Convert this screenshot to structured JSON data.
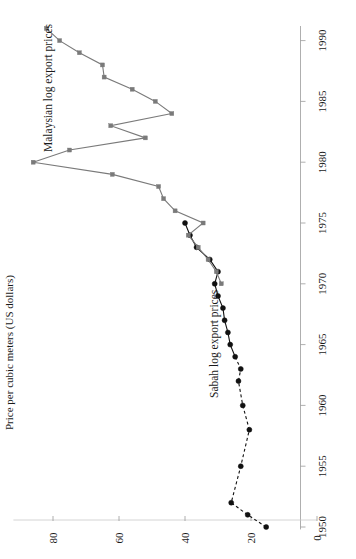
{
  "chart_data": {
    "type": "line",
    "title": "",
    "orientation": "rotated-90",
    "xlabel": "Price per cubic meters (US dollars)",
    "ylabel": "",
    "value_axis": {
      "name": "Price per cubic meters (US dollars)",
      "ticks": [
        0,
        20,
        40,
        60,
        80
      ],
      "tick_labels": [
        "0",
        "20",
        "40",
        "60",
        "80"
      ],
      "range": [
        0,
        92
      ]
    },
    "year_axis": {
      "name": "",
      "ticks": [
        1950,
        1955,
        1960,
        1965,
        1970,
        1975,
        1980,
        1985,
        1990
      ],
      "tick_labels": [
        "1950",
        "1955",
        "1960",
        "1965",
        "1970",
        "1975",
        "1980",
        "1985",
        "1990"
      ],
      "range": [
        1949,
        1991
      ]
    },
    "grid": false,
    "legend": "inline-annotations",
    "series": [
      {
        "name": "Sabah log export prices",
        "color": "#111111",
        "marker": "filled-circle",
        "dashed_until": 1963,
        "points": [
          {
            "year": 1950,
            "value": 15.4
          },
          {
            "year": 1951,
            "value": 21.0
          },
          {
            "year": 1952,
            "value": 26.0
          },
          {
            "year": 1955,
            "value": 23.1
          },
          {
            "year": 1958,
            "value": 20.5
          },
          {
            "year": 1960,
            "value": 22.5
          },
          {
            "year": 1962,
            "value": 23.8
          },
          {
            "year": 1963,
            "value": 23.1
          },
          {
            "year": 1964,
            "value": 24.8
          },
          {
            "year": 1965,
            "value": 26.3
          },
          {
            "year": 1966,
            "value": 27.0
          },
          {
            "year": 1967,
            "value": 28.0
          },
          {
            "year": 1968,
            "value": 28.5
          },
          {
            "year": 1969,
            "value": 30.0
          },
          {
            "year": 1970,
            "value": 31.0
          },
          {
            "year": 1971,
            "value": 30.0
          },
          {
            "year": 1972,
            "value": 32.5
          },
          {
            "year": 1973,
            "value": 36.5
          },
          {
            "year": 1974,
            "value": 38.5
          },
          {
            "year": 1975,
            "value": 40.0
          }
        ]
      },
      {
        "name": "Malaysian log export prices",
        "color": "#7a7a7a",
        "marker": "small-square",
        "dashed_until": null,
        "points": [
          {
            "year": 1970,
            "value": 29.0
          },
          {
            "year": 1971,
            "value": 30.5
          },
          {
            "year": 1972,
            "value": 33.0
          },
          {
            "year": 1973,
            "value": 36.0
          },
          {
            "year": 1974,
            "value": 39.0
          },
          {
            "year": 1975,
            "value": 34.5
          },
          {
            "year": 1976,
            "value": 43.0
          },
          {
            "year": 1977,
            "value": 46.5
          },
          {
            "year": 1978,
            "value": 48.0
          },
          {
            "year": 1979,
            "value": 62.0
          },
          {
            "year": 1980,
            "value": 86.0
          },
          {
            "year": 1981,
            "value": 75.0
          },
          {
            "year": 1982,
            "value": 52.0
          },
          {
            "year": 1983,
            "value": 62.5
          },
          {
            "year": 1984,
            "value": 44.0
          },
          {
            "year": 1985,
            "value": 49.0
          },
          {
            "year": 1986,
            "value": 56.0
          },
          {
            "year": 1987,
            "value": 64.5
          },
          {
            "year": 1988,
            "value": 65.0
          },
          {
            "year": 1989,
            "value": 72.0
          },
          {
            "year": 1990,
            "value": 78.0
          },
          {
            "year": 1991,
            "value": 82.0
          }
        ]
      }
    ],
    "annotations": [
      {
        "text": "Malaysian log export prices",
        "series": "Malaysian log export prices"
      },
      {
        "text": "Sabah log export prices",
        "series": "Sabah log export prices"
      }
    ]
  },
  "axis": {
    "value_title": "Price per cubic meters (US dollars)",
    "value_ticks": [
      "80",
      "60",
      "40",
      "20",
      "0"
    ],
    "year_ticks": [
      "1990",
      "1985",
      "1980",
      "1975",
      "1970",
      "1965",
      "1960",
      "1955",
      "1950"
    ]
  },
  "labels": {
    "malaysian": "Malaysian log export prices",
    "sabah": "Sabah log export prices"
  }
}
